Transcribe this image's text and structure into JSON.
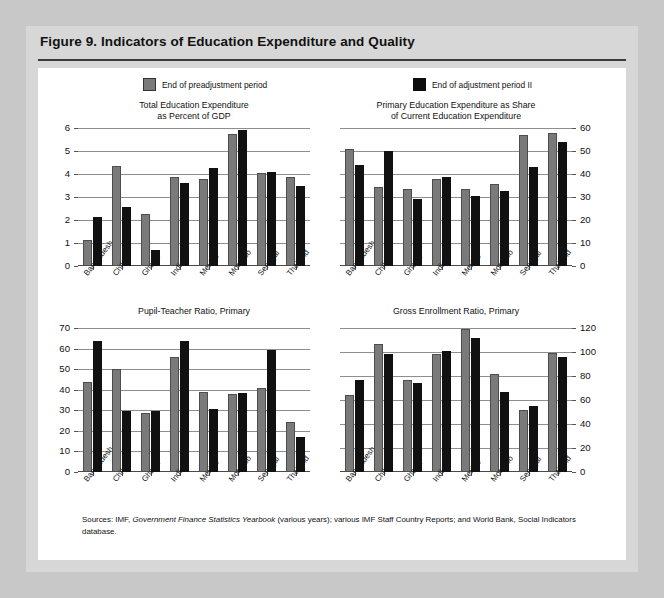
{
  "figure": {
    "title": "Figure 9.  Indicators of Education Expenditure and Quality",
    "source_prefix": "Sources:  IMF, ",
    "source_italic": "Government Finance Statistics Yearbook",
    "source_suffix": " (various years); various IMF Staff Country Reports; and World Bank, Social Indicators database."
  },
  "legend": {
    "items": [
      {
        "label": "End of preadjustment period",
        "color": "#7a7a7a",
        "key": "pre"
      },
      {
        "label": "End of adjustment period II",
        "color": "#111111",
        "key": "adj"
      }
    ]
  },
  "colors": {
    "series_pre": "#7a7a7a",
    "series_adj": "#111111",
    "gridline": "#8e8e8e",
    "page_background": "#c8c8c8",
    "card_background": "#d7d7d7",
    "panel_background": "#ffffff"
  },
  "chart_data": [
    {
      "id": "total-education-expenditure",
      "type": "bar",
      "title": "Total Education Expenditure\nas Percent of GDP",
      "title_lines": [
        "Total Education Expenditure",
        "as Percent of GDP"
      ],
      "xlabel": "",
      "ylabel": "",
      "ylim": [
        0,
        6
      ],
      "yticks": [
        0,
        1,
        2,
        3,
        4,
        5,
        6
      ],
      "ytick_labels": [
        "0",
        "1",
        "2",
        "3",
        "4",
        "5",
        "6"
      ],
      "axis_side": "left",
      "grid": true,
      "legend_position": "figure-top",
      "categories": [
        "Bangladesh",
        "Chile",
        "Ghana",
        "India",
        "Mexico",
        "Morocco",
        "Senegal",
        "Thailand"
      ],
      "series": [
        {
          "name": "End of preadjustment period",
          "color": "#7a7a7a",
          "values": [
            1.15,
            4.35,
            2.25,
            3.85,
            3.8,
            5.75,
            4.05,
            3.85
          ]
        },
        {
          "name": "End of adjustment period II",
          "color": "#111111",
          "values": [
            2.15,
            2.55,
            0.7,
            3.6,
            4.25,
            5.9,
            4.1,
            3.5
          ]
        }
      ]
    },
    {
      "id": "primary-education-share",
      "type": "bar",
      "title": "Primary Education Expenditure as Share\nof Current Education Expenditure",
      "title_lines": [
        "Primary Education Expenditure as Share",
        "of Current Education Expenditure"
      ],
      "xlabel": "",
      "ylabel": "",
      "ylim": [
        0,
        60
      ],
      "yticks": [
        0,
        10,
        20,
        30,
        40,
        50,
        60
      ],
      "ytick_labels": [
        "0",
        "10",
        "20",
        "30",
        "40",
        "50",
        "60"
      ],
      "axis_side": "right",
      "grid": true,
      "legend_position": "figure-top",
      "categories": [
        "Bangladesh",
        "Chile",
        "Ghana",
        "India",
        "Mexico",
        "Morocco",
        "Senegal",
        "Thailand"
      ],
      "series": [
        {
          "name": "End of preadjustment period",
          "color": "#7a7a7a",
          "values": [
            51,
            34.5,
            33.5,
            38,
            33.5,
            35.5,
            57,
            58
          ]
        },
        {
          "name": "End of adjustment period II",
          "color": "#111111",
          "values": [
            44,
            50,
            29,
            38.5,
            30.5,
            32.5,
            43,
            54
          ]
        }
      ]
    },
    {
      "id": "pupil-teacher-ratio",
      "type": "bar",
      "title": "Pupil-Teacher Ratio, Primary",
      "title_lines": [
        "Pupil-Teacher Ratio, Primary"
      ],
      "xlabel": "",
      "ylabel": "",
      "ylim": [
        0,
        70
      ],
      "yticks": [
        0,
        10,
        20,
        30,
        40,
        50,
        60,
        70
      ],
      "ytick_labels": [
        "0",
        "10",
        "20",
        "30",
        "40",
        "50",
        "60",
        "70"
      ],
      "axis_side": "left",
      "grid": true,
      "legend_position": "figure-top",
      "categories": [
        "Bangladesh",
        "Chile",
        "Ghana",
        "India",
        "Mexico",
        "Morocco",
        "Senegal",
        "Thailand"
      ],
      "series": [
        {
          "name": "End of preadjustment period",
          "color": "#7a7a7a",
          "values": [
            44,
            50,
            28.5,
            56,
            39,
            38,
            41,
            24.5
          ]
        },
        {
          "name": "End of adjustment period II",
          "color": "#111111",
          "values": [
            63.5,
            29.5,
            29.5,
            63.5,
            30.5,
            38.5,
            59.5,
            17
          ]
        }
      ]
    },
    {
      "id": "gross-enrollment-ratio",
      "type": "bar",
      "title": "Gross Enrollment Ratio, Primary",
      "title_lines": [
        "Gross Enrollment Ratio, Primary"
      ],
      "xlabel": "",
      "ylabel": "",
      "ylim": [
        0,
        120
      ],
      "yticks": [
        0,
        20,
        40,
        60,
        80,
        100,
        120
      ],
      "ytick_labels": [
        "0",
        "20",
        "40",
        "60",
        "80",
        "100",
        "120"
      ],
      "axis_side": "right",
      "grid": true,
      "legend_position": "figure-top",
      "categories": [
        "Bangladesh",
        "Chile",
        "Ghana",
        "India",
        "Mexico",
        "Morocco",
        "Senegal",
        "Thailand"
      ],
      "series": [
        {
          "name": "End of preadjustment period",
          "color": "#7a7a7a",
          "values": [
            64,
            107,
            77,
            98,
            119,
            82,
            52,
            99
          ]
        },
        {
          "name": "End of adjustment period II",
          "color": "#111111",
          "values": [
            77,
            98.5,
            74,
            101,
            112,
            67,
            55,
            96
          ]
        }
      ]
    }
  ]
}
